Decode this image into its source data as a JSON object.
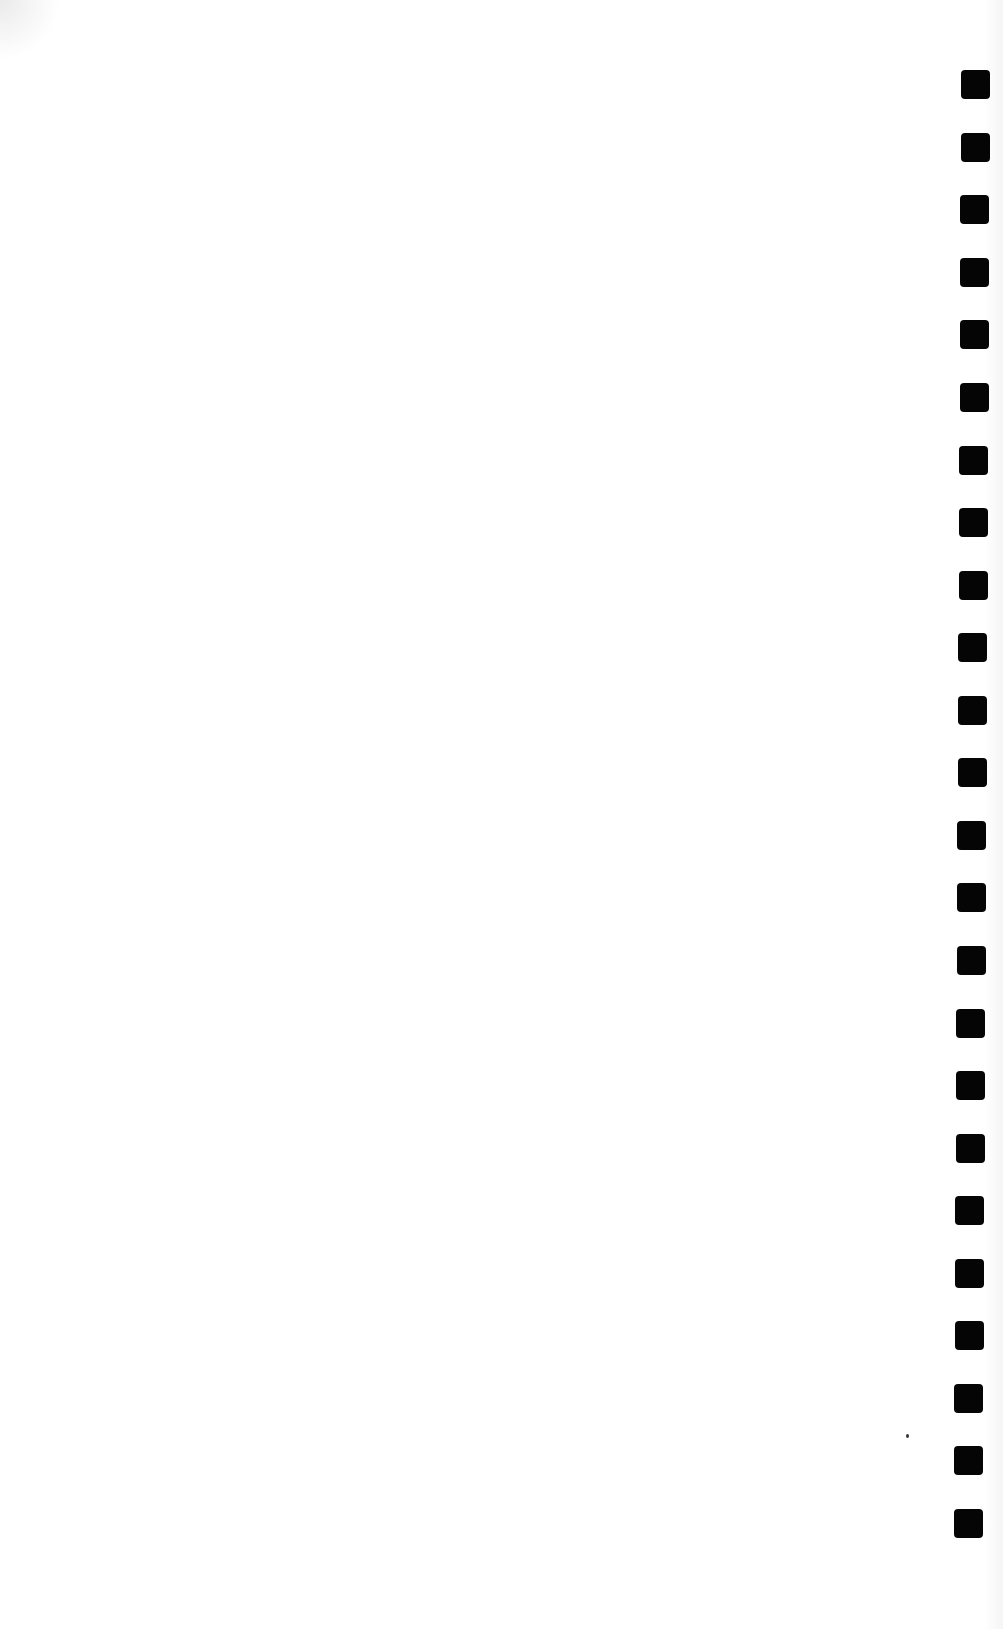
{
  "document": {
    "type": "scanned-page",
    "content_text": "",
    "background_color": "#ffffff",
    "binding": {
      "kind": "punched-holes",
      "side": "right",
      "hole_count": 24,
      "hole_color": "#050505",
      "holes": [
        {
          "x": 961,
          "y": 70
        },
        {
          "x": 961,
          "y": 133
        },
        {
          "x": 960,
          "y": 195
        },
        {
          "x": 960,
          "y": 258
        },
        {
          "x": 960,
          "y": 320
        },
        {
          "x": 960,
          "y": 383
        },
        {
          "x": 959,
          "y": 446
        },
        {
          "x": 959,
          "y": 508
        },
        {
          "x": 959,
          "y": 571
        },
        {
          "x": 958,
          "y": 633
        },
        {
          "x": 958,
          "y": 696
        },
        {
          "x": 958,
          "y": 758
        },
        {
          "x": 957,
          "y": 821
        },
        {
          "x": 957,
          "y": 883
        },
        {
          "x": 957,
          "y": 946
        },
        {
          "x": 956,
          "y": 1009
        },
        {
          "x": 956,
          "y": 1071
        },
        {
          "x": 956,
          "y": 1134
        },
        {
          "x": 955,
          "y": 1196
        },
        {
          "x": 955,
          "y": 1259
        },
        {
          "x": 955,
          "y": 1321
        },
        {
          "x": 954,
          "y": 1384
        },
        {
          "x": 954,
          "y": 1446
        },
        {
          "x": 954,
          "y": 1509
        }
      ]
    },
    "specks": [
      {
        "x": 906,
        "y": 1434
      }
    ]
  }
}
